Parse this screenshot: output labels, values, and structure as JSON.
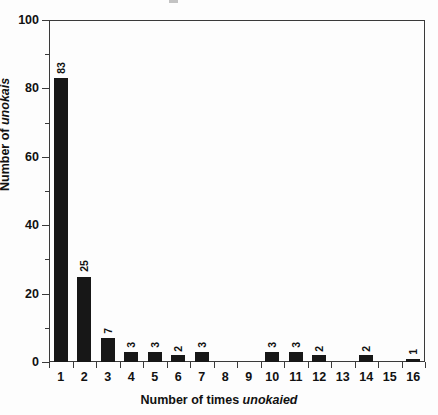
{
  "chart_data": {
    "type": "bar",
    "title": "",
    "subtitle": "",
    "xlabel_prefix": "Number of times ",
    "xlabel_emphasis": "unokaied",
    "xlabel": "Number of times unokaied",
    "ylabel_prefix": "Number of ",
    "ylabel_emphasis": "unokais",
    "ylabel": "Number of unokais",
    "categories": [
      "1",
      "2",
      "3",
      "4",
      "5",
      "6",
      "7",
      "8",
      "9",
      "10",
      "11",
      "12",
      "13",
      "14",
      "15",
      "16"
    ],
    "values": [
      83,
      25,
      7,
      3,
      3,
      2,
      3,
      0,
      0,
      3,
      3,
      2,
      0,
      2,
      0,
      1
    ],
    "bar_labels": [
      "83",
      "25",
      "7",
      "3",
      "3",
      "2",
      "3",
      "",
      "",
      "3",
      "3",
      "2",
      "",
      "2",
      "",
      "1"
    ],
    "ylim": [
      0,
      100
    ],
    "y_major_ticks": [
      0,
      20,
      40,
      60,
      80,
      100
    ],
    "y_major_tick_labels": [
      "0",
      "20",
      "40",
      "60",
      "80",
      "100"
    ],
    "y_minor_ticks": [
      10,
      30,
      50,
      70,
      90
    ],
    "grid": false,
    "legend": false,
    "legend_position": "none",
    "bar_color": "#171717",
    "axis_color": "#3a3a3a",
    "text_color": "#111111",
    "background_color": "#fdfdfd",
    "value_label_rotation": -90,
    "bar_width_fraction": 0.6
  }
}
